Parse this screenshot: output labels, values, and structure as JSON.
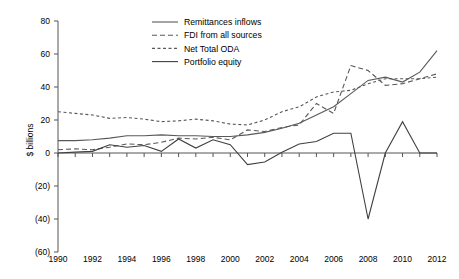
{
  "chart_data": {
    "type": "line",
    "title": "",
    "xlabel": "",
    "ylabel": "$ billions",
    "xlim": [
      1990,
      2012
    ],
    "ylim": [
      -60,
      80
    ],
    "ytick_labels": [
      "80",
      "60",
      "40",
      "20",
      "0",
      "(20)",
      "(40)",
      "(60)"
    ],
    "ytick_values": [
      80,
      60,
      40,
      20,
      0,
      -20,
      -40,
      -60
    ],
    "xtick_labels": [
      "1990",
      "1992",
      "1994",
      "1996",
      "1998",
      "2000",
      "2002",
      "2004",
      "2006",
      "2008",
      "2010",
      "2012"
    ],
    "xtick_values": [
      1990,
      1992,
      1994,
      1996,
      1998,
      2000,
      2002,
      2004,
      2006,
      2008,
      2010,
      2012
    ],
    "grid": false,
    "legend_position": "top-center",
    "x": [
      1990,
      1991,
      1992,
      1993,
      1994,
      1995,
      1996,
      1997,
      1998,
      1999,
      2000,
      2001,
      2002,
      2003,
      2004,
      2005,
      2006,
      2007,
      2008,
      2009,
      2010,
      2011,
      2012
    ],
    "series": [
      {
        "name": "Remittances inflows",
        "style": "solid",
        "color": "#595959",
        "values": [
          7.5,
          7.5,
          8.0,
          9.0,
          10.5,
          10.5,
          11.0,
          10.5,
          10.5,
          10.0,
          10.0,
          11.0,
          12.5,
          15.0,
          18.0,
          23.0,
          28.0,
          36.0,
          44.0,
          46.0,
          43.0,
          49.0,
          62.0
        ]
      },
      {
        "name": "FDI from all sources",
        "style": "dashed",
        "color": "#595959",
        "values": [
          2.0,
          2.5,
          2.0,
          3.5,
          5.5,
          5.0,
          6.5,
          9.0,
          8.5,
          9.5,
          8.0,
          14.0,
          13.0,
          15.5,
          17.0,
          30.0,
          24.0,
          53.0,
          50.0,
          41.0,
          42.0,
          45.0,
          48.0
        ]
      },
      {
        "name": "Net Total ODA",
        "style": "dashed-fine",
        "color": "#595959",
        "values": [
          25.0,
          24.0,
          23.0,
          21.0,
          21.5,
          20.5,
          19.0,
          19.5,
          20.5,
          19.5,
          17.5,
          17.0,
          20.0,
          25.0,
          28.0,
          34.0,
          37.0,
          38.0,
          42.0,
          45.0,
          45.0,
          45.0,
          46.0
        ]
      },
      {
        "name": "Portfolio equity",
        "style": "solid",
        "color": "#404040",
        "values": [
          0.0,
          0.5,
          1.0,
          5.0,
          3.5,
          4.5,
          1.0,
          8.5,
          3.0,
          8.0,
          5.0,
          -7.0,
          -5.5,
          0.5,
          5.5,
          7.0,
          12.0,
          12.0,
          -40.0,
          0.0,
          19.0,
          0.0,
          0.0
        ]
      }
    ]
  },
  "legend": {
    "entries": [
      {
        "label": "Remittances inflows"
      },
      {
        "label": "FDI from all sources"
      },
      {
        "label": "Net Total ODA"
      },
      {
        "label": "Portfolio equity"
      }
    ]
  }
}
